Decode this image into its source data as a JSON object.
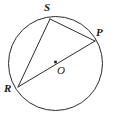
{
  "figure": {
    "type": "circle-geometry-diagram",
    "background_color": "#ffffff",
    "stroke_color": "#2b2b2b",
    "label_color": "#1a1a1a",
    "circle": {
      "center_x": 55.5,
      "center_y": 63.5,
      "radius": 47.0,
      "stroke_width": 1.0,
      "fill": "none"
    },
    "center_point": {
      "name": "center-dot",
      "x": 55.5,
      "y": 62.0,
      "size": 2.6
    },
    "points": [
      {
        "id": "S",
        "label": "S",
        "x": 50.0,
        "y": 19.0,
        "label_x": 44,
        "label_y": 2
      },
      {
        "id": "P",
        "label": "P",
        "x": 95.0,
        "y": 41.0,
        "label_x": 96,
        "label_y": 27
      },
      {
        "id": "R",
        "label": "R",
        "x": 18.0,
        "y": 87.0,
        "label_x": 4,
        "label_y": 83
      },
      {
        "id": "O",
        "label": "O",
        "x": 55.5,
        "y": 62.0,
        "label_x": 57,
        "label_y": 65
      }
    ],
    "segments": [
      {
        "id": "SR",
        "from": "S",
        "to": "R",
        "x1": 50.0,
        "y1": 19.0,
        "x2": 18.0,
        "y2": 87.0,
        "kind": "chord"
      },
      {
        "id": "SP",
        "from": "S",
        "to": "P",
        "x1": 50.0,
        "y1": 19.0,
        "x2": 95.0,
        "y2": 41.0,
        "kind": "chord"
      },
      {
        "id": "RP",
        "from": "R",
        "to": "P",
        "x1": 18.0,
        "y1": 87.0,
        "x2": 95.0,
        "y2": 41.0,
        "kind": "diameter"
      }
    ]
  }
}
